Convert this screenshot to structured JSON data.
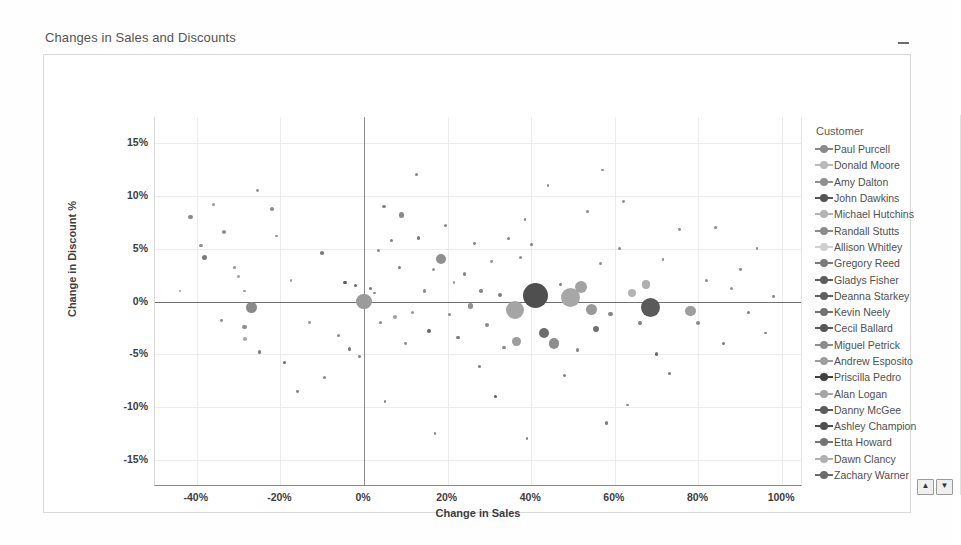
{
  "title": "Changes in Sales and Discounts",
  "minimize_icon": "minimize-icon",
  "axes": {
    "x_title": "Change in Sales",
    "y_title": "Change in Discount %",
    "x_ticks": [
      "-40%",
      "-20%",
      "0%",
      "20%",
      "40%",
      "60%",
      "80%",
      "100%"
    ],
    "y_ticks": [
      "15%",
      "10%",
      "5%",
      "0%",
      "-5%",
      "-10%",
      "-15%"
    ]
  },
  "legend": {
    "title": "Customer",
    "scroll_up": "▲",
    "scroll_down": "▼",
    "items": [
      {
        "label": "Paul Purcell",
        "color": "#8a8a8a"
      },
      {
        "label": "Donald Moore",
        "color": "#b9b9b9"
      },
      {
        "label": "Amy Dalton",
        "color": "#8f8f8f"
      },
      {
        "label": "John Dawkins",
        "color": "#545454"
      },
      {
        "label": "Michael Hutchins",
        "color": "#b2b2b2"
      },
      {
        "label": "Randall Stutts",
        "color": "#8c8c8c"
      },
      {
        "label": "Allison Whitley",
        "color": "#cfcfcf"
      },
      {
        "label": "Gregory Reed",
        "color": "#7b7b7b"
      },
      {
        "label": "Gladys Fisher",
        "color": "#5e5e5e"
      },
      {
        "label": "Deanna Starkey",
        "color": "#616161"
      },
      {
        "label": "Kevin Neely",
        "color": "#727272"
      },
      {
        "label": "Cecil Ballard",
        "color": "#575757"
      },
      {
        "label": "Miguel Petrick",
        "color": "#8d8d8d"
      },
      {
        "label": "Andrew Esposito",
        "color": "#9d9d9d"
      },
      {
        "label": "Priscilla Pedro",
        "color": "#3f3f3f"
      },
      {
        "label": "Alan Logan",
        "color": "#a4a4a4"
      },
      {
        "label": "Danny McGee",
        "color": "#5b5b5b"
      },
      {
        "label": "Ashley Champion",
        "color": "#4d4d4d"
      },
      {
        "label": "Etta Howard",
        "color": "#747474"
      },
      {
        "label": "Dawn Clancy",
        "color": "#b0b0b0"
      },
      {
        "label": "Zachary Warner",
        "color": "#6b6b6b"
      }
    ]
  },
  "chart_data": {
    "type": "scatter",
    "title": "Changes in Sales and Discounts",
    "xlabel": "Change in Sales",
    "ylabel": "Change in Discount %",
    "xlim": [
      -50,
      105
    ],
    "ylim": [
      -17.5,
      17.5
    ],
    "grid": true,
    "legend_position": "right",
    "size_encoding": "bubble area = sales volume",
    "reference_lines": {
      "x": 0,
      "y": 0
    },
    "points": [
      {
        "x": -41.5,
        "y": 8.0,
        "r": 2.2,
        "c": "#8a8a8a"
      },
      {
        "x": -36.0,
        "y": 9.2,
        "r": 1.6,
        "c": "#9a9a9a"
      },
      {
        "x": -39.0,
        "y": 5.3,
        "r": 1.6,
        "c": "#8f8f8f"
      },
      {
        "x": -38.2,
        "y": 4.2,
        "r": 2.5,
        "c": "#7b7b7b"
      },
      {
        "x": -33.5,
        "y": 6.6,
        "r": 2.0,
        "c": "#8d8d8d"
      },
      {
        "x": -31.0,
        "y": 3.2,
        "r": 1.6,
        "c": "#949494"
      },
      {
        "x": -30.0,
        "y": 2.4,
        "r": 1.5,
        "c": "#a0a0a0"
      },
      {
        "x": -28.5,
        "y": 1.0,
        "r": 1.4,
        "c": "#9b9b9b"
      },
      {
        "x": -27.0,
        "y": -0.6,
        "r": 5.6,
        "c": "#8a8a8a"
      },
      {
        "x": -28.6,
        "y": -2.4,
        "r": 2.3,
        "c": "#8f8f8f"
      },
      {
        "x": -28.5,
        "y": -3.6,
        "r": 2.0,
        "c": "#a6a6a6"
      },
      {
        "x": -25.0,
        "y": -4.8,
        "r": 1.7,
        "c": "#7f7f7f"
      },
      {
        "x": -22.0,
        "y": 8.8,
        "r": 2.0,
        "c": "#8c8c8c"
      },
      {
        "x": -25.5,
        "y": 10.5,
        "r": 1.4,
        "c": "#949494"
      },
      {
        "x": -19.0,
        "y": -5.8,
        "r": 1.6,
        "c": "#6f6f6f"
      },
      {
        "x": -17.5,
        "y": 2.0,
        "r": 1.3,
        "c": "#9e9e9e"
      },
      {
        "x": -13.0,
        "y": -2.0,
        "r": 1.3,
        "c": "#a2a2a2"
      },
      {
        "x": -10.0,
        "y": 4.6,
        "r": 1.8,
        "c": "#7c7c7c"
      },
      {
        "x": -9.5,
        "y": -7.2,
        "r": 1.6,
        "c": "#888888"
      },
      {
        "x": -6.0,
        "y": -3.2,
        "r": 1.5,
        "c": "#8b8b8b"
      },
      {
        "x": -4.5,
        "y": 1.8,
        "r": 1.9,
        "c": "#5f5f5f"
      },
      {
        "x": -2.0,
        "y": 1.5,
        "r": 1.8,
        "c": "#6b6b6b"
      },
      {
        "x": -3.5,
        "y": -4.5,
        "r": 1.7,
        "c": "#7a7a7a"
      },
      {
        "x": -1.0,
        "y": -5.2,
        "r": 1.5,
        "c": "#868686"
      },
      {
        "x": 0.0,
        "y": 0.0,
        "r": 7.8,
        "c": "#9b9b9b"
      },
      {
        "x": 1.5,
        "y": 1.2,
        "r": 1.6,
        "c": "#777777"
      },
      {
        "x": 2.5,
        "y": 0.8,
        "r": 1.4,
        "c": "#8e8e8e"
      },
      {
        "x": 3.5,
        "y": 4.8,
        "r": 1.5,
        "c": "#8a8a8a"
      },
      {
        "x": 4.0,
        "y": -2.0,
        "r": 1.6,
        "c": "#8c8c8c"
      },
      {
        "x": 4.8,
        "y": 9.0,
        "r": 1.7,
        "c": "#858585"
      },
      {
        "x": 6.5,
        "y": 5.8,
        "r": 1.5,
        "c": "#828282"
      },
      {
        "x": 7.5,
        "y": -1.5,
        "r": 2.0,
        "c": "#a0a0a0"
      },
      {
        "x": 8.5,
        "y": 3.2,
        "r": 1.6,
        "c": "#7e7e7e"
      },
      {
        "x": 9.0,
        "y": 8.2,
        "r": 2.6,
        "c": "#8a8a8a"
      },
      {
        "x": 10.0,
        "y": -4.0,
        "r": 1.4,
        "c": "#909090"
      },
      {
        "x": 11.5,
        "y": -1.0,
        "r": 1.5,
        "c": "#9a9a9a"
      },
      {
        "x": 12.5,
        "y": 12.0,
        "r": 1.5,
        "c": "#8b8b8b"
      },
      {
        "x": 13.0,
        "y": 6.0,
        "r": 1.8,
        "c": "#797979"
      },
      {
        "x": 14.5,
        "y": 1.0,
        "r": 1.6,
        "c": "#8e8e8e"
      },
      {
        "x": 15.5,
        "y": -2.8,
        "r": 2.2,
        "c": "#666666"
      },
      {
        "x": 16.5,
        "y": 3.0,
        "r": 1.5,
        "c": "#959595"
      },
      {
        "x": 18.5,
        "y": 4.0,
        "r": 5.0,
        "c": "#8f8f8f"
      },
      {
        "x": 19.5,
        "y": 7.2,
        "r": 1.5,
        "c": "#888888"
      },
      {
        "x": 20.5,
        "y": -1.2,
        "r": 1.6,
        "c": "#8d8d8d"
      },
      {
        "x": 21.5,
        "y": 1.8,
        "r": 1.4,
        "c": "#9c9c9c"
      },
      {
        "x": 22.5,
        "y": -3.4,
        "r": 1.8,
        "c": "#7b7b7b"
      },
      {
        "x": 24.0,
        "y": 2.6,
        "r": 1.6,
        "c": "#868686"
      },
      {
        "x": 25.5,
        "y": -0.4,
        "r": 2.8,
        "c": "#909090"
      },
      {
        "x": 26.5,
        "y": 5.5,
        "r": 1.4,
        "c": "#8a8a8a"
      },
      {
        "x": 27.5,
        "y": -6.2,
        "r": 1.5,
        "c": "#7d7d7d"
      },
      {
        "x": 28.0,
        "y": 1.0,
        "r": 1.7,
        "c": "#888888"
      },
      {
        "x": 29.5,
        "y": -2.2,
        "r": 2.0,
        "c": "#8b8b8b"
      },
      {
        "x": 30.5,
        "y": 3.8,
        "r": 1.4,
        "c": "#979797"
      },
      {
        "x": 31.5,
        "y": -9.0,
        "r": 1.7,
        "c": "#5d5d5d"
      },
      {
        "x": 32.5,
        "y": 0.6,
        "r": 2.2,
        "c": "#7f7f7f"
      },
      {
        "x": 33.5,
        "y": -4.4,
        "r": 1.6,
        "c": "#8c8c8c"
      },
      {
        "x": 34.5,
        "y": 6.0,
        "r": 1.5,
        "c": "#848484"
      },
      {
        "x": 36.0,
        "y": -0.8,
        "r": 9.0,
        "c": "#a5a5a5"
      },
      {
        "x": 36.5,
        "y": -3.8,
        "r": 4.2,
        "c": "#9d9d9d"
      },
      {
        "x": 37.5,
        "y": 4.2,
        "r": 1.6,
        "c": "#8d8d8d"
      },
      {
        "x": 38.5,
        "y": 7.8,
        "r": 1.4,
        "c": "#8a8a8a"
      },
      {
        "x": 41.0,
        "y": 0.6,
        "r": 12.5,
        "c": "#4f4f4f"
      },
      {
        "x": 40.0,
        "y": 5.4,
        "r": 1.5,
        "c": "#818181"
      },
      {
        "x": 43.0,
        "y": -3.0,
        "r": 5.0,
        "c": "#6d6d6d"
      },
      {
        "x": 45.5,
        "y": -4.0,
        "r": 5.2,
        "c": "#8e8e8e"
      },
      {
        "x": 47.0,
        "y": 1.6,
        "r": 1.5,
        "c": "#7e7e7e"
      },
      {
        "x": 48.0,
        "y": -7.0,
        "r": 1.5,
        "c": "#868686"
      },
      {
        "x": 49.5,
        "y": 0.4,
        "r": 9.5,
        "c": "#a7a7a7"
      },
      {
        "x": 52.0,
        "y": 1.4,
        "r": 6.0,
        "c": "#a2a2a2"
      },
      {
        "x": 51.0,
        "y": -4.6,
        "r": 1.6,
        "c": "#8b8b8b"
      },
      {
        "x": 53.5,
        "y": 8.5,
        "r": 1.5,
        "c": "#898989"
      },
      {
        "x": 54.5,
        "y": -0.8,
        "r": 5.5,
        "c": "#999999"
      },
      {
        "x": 55.5,
        "y": -2.6,
        "r": 3.0,
        "c": "#707070"
      },
      {
        "x": 56.5,
        "y": 3.6,
        "r": 1.5,
        "c": "#8f8f8f"
      },
      {
        "x": 58.0,
        "y": -11.5,
        "r": 1.8,
        "c": "#7a7a7a"
      },
      {
        "x": 59.0,
        "y": -1.2,
        "r": 2.2,
        "c": "#848484"
      },
      {
        "x": 61.0,
        "y": 5.0,
        "r": 1.5,
        "c": "#8d8d8d"
      },
      {
        "x": 62.0,
        "y": 9.5,
        "r": 1.4,
        "c": "#929292"
      },
      {
        "x": 64.0,
        "y": 0.8,
        "r": 4.0,
        "c": "#b4b4b4"
      },
      {
        "x": 66.0,
        "y": -2.0,
        "r": 2.0,
        "c": "#7f7f7f"
      },
      {
        "x": 68.5,
        "y": -0.6,
        "r": 9.5,
        "c": "#5a5a5a"
      },
      {
        "x": 67.5,
        "y": 1.6,
        "r": 4.2,
        "c": "#aeaeae"
      },
      {
        "x": 70.0,
        "y": -5.0,
        "r": 1.8,
        "c": "#6c6c6c"
      },
      {
        "x": 71.5,
        "y": 4.0,
        "r": 1.4,
        "c": "#8e8e8e"
      },
      {
        "x": 73.0,
        "y": -6.8,
        "r": 1.6,
        "c": "#7b7b7b"
      },
      {
        "x": 75.5,
        "y": 6.8,
        "r": 1.4,
        "c": "#909090"
      },
      {
        "x": 78.0,
        "y": -0.9,
        "r": 5.4,
        "c": "#9e9e9e"
      },
      {
        "x": 80.0,
        "y": -2.0,
        "r": 2.0,
        "c": "#8a8a8a"
      },
      {
        "x": 82.0,
        "y": 2.0,
        "r": 1.5,
        "c": "#8c8c8c"
      },
      {
        "x": 84.0,
        "y": 7.0,
        "r": 1.5,
        "c": "#858585"
      },
      {
        "x": 86.0,
        "y": -4.0,
        "r": 1.6,
        "c": "#7d7d7d"
      },
      {
        "x": 88.0,
        "y": 1.2,
        "r": 1.5,
        "c": "#979797"
      },
      {
        "x": 90.0,
        "y": 3.0,
        "r": 1.4,
        "c": "#8b8b8b"
      },
      {
        "x": 92.0,
        "y": -1.0,
        "r": 1.5,
        "c": "#838383"
      },
      {
        "x": 94.0,
        "y": 5.0,
        "r": 1.4,
        "c": "#8f8f8f"
      },
      {
        "x": 96.0,
        "y": -3.0,
        "r": 1.3,
        "c": "#888888"
      },
      {
        "x": 98.0,
        "y": 0.5,
        "r": 1.3,
        "c": "#909090"
      },
      {
        "x": -44.0,
        "y": 1.0,
        "r": 1.4,
        "c": "#999999"
      },
      {
        "x": -34.0,
        "y": -1.8,
        "r": 1.4,
        "c": "#8d8d8d"
      },
      {
        "x": -21.0,
        "y": 6.2,
        "r": 1.3,
        "c": "#959595"
      },
      {
        "x": -16.0,
        "y": -8.5,
        "r": 1.4,
        "c": "#818181"
      },
      {
        "x": 5.0,
        "y": -9.5,
        "r": 1.3,
        "c": "#8a8a8a"
      },
      {
        "x": 17.0,
        "y": -12.5,
        "r": 1.3,
        "c": "#8e8e8e"
      },
      {
        "x": 39.0,
        "y": -13.0,
        "r": 1.2,
        "c": "#888888"
      },
      {
        "x": 63.0,
        "y": -9.8,
        "r": 1.3,
        "c": "#8c8c8c"
      },
      {
        "x": 44.0,
        "y": 11.0,
        "r": 1.3,
        "c": "#8b8b8b"
      },
      {
        "x": 57.0,
        "y": 12.5,
        "r": 1.2,
        "c": "#909090"
      }
    ]
  }
}
